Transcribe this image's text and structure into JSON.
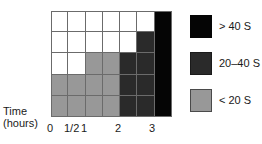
{
  "chart_data": {
    "type": "heatmap",
    "title": "",
    "xlabel": "Time (hours)",
    "ylabel": "",
    "grid": true,
    "legend_position": "right",
    "columns": 7,
    "rows": 5,
    "xtick_labels": [
      "0",
      "1/2",
      "1",
      "2",
      "3"
    ],
    "xtick_positions_px": [
      51,
      68,
      85,
      119,
      153
    ],
    "categories": [
      "0",
      "1/2",
      "1",
      "1.5",
      "2",
      "2.5",
      "3"
    ],
    "legend": [
      {
        "label": "> 40 S",
        "color": "#050505",
        "key": "high"
      },
      {
        "label": "20–40 S",
        "color": "#2a2a2a",
        "key": "mid"
      },
      {
        "label": "< 20 S",
        "color": "#989898",
        "key": "low"
      }
    ],
    "cell_values": [
      [
        "none",
        "none",
        "none",
        "none",
        "none",
        "none",
        "high"
      ],
      [
        "none",
        "none",
        "none",
        "none",
        "none",
        "mid",
        "high"
      ],
      [
        "none",
        "none",
        "low",
        "low",
        "mid",
        "mid",
        "high"
      ],
      [
        "low",
        "low",
        "low",
        "low",
        "mid",
        "mid",
        "high"
      ],
      [
        "low",
        "low",
        "low",
        "low",
        "mid",
        "mid",
        "high"
      ]
    ]
  },
  "axis": {
    "title_line1": "Time",
    "title_line2": "(hours)"
  },
  "colors": {
    "low": "#989898",
    "mid": "#2a2a2a",
    "high": "#050505",
    "none": "#ffffff",
    "gridline": "#6b6b6b",
    "text": "#1a1a1a"
  }
}
